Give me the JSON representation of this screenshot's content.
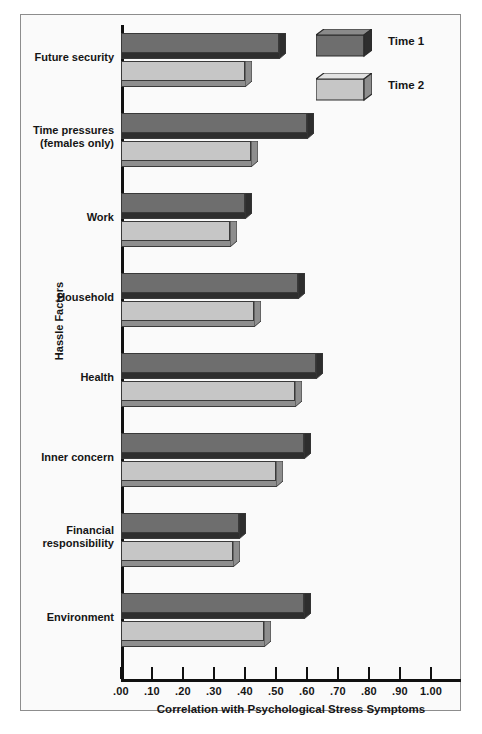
{
  "chart_data": {
    "type": "bar",
    "orientation": "horizontal",
    "title": "",
    "xlabel": "Correlation with Psychological Stress Symptoms",
    "ylabel": "Hassle Factors",
    "xlim": [
      0.0,
      1.0
    ],
    "grid": false,
    "legend_position": "top-right",
    "xticks": [
      ".00",
      ".10",
      ".20",
      ".30",
      ".40",
      ".50",
      ".60",
      ".70",
      ".80",
      ".90",
      "1.00"
    ],
    "xtick_values": [
      0.0,
      0.1,
      0.2,
      0.3,
      0.4,
      0.5,
      0.6,
      0.7,
      0.8,
      0.9,
      1.0
    ],
    "categories": [
      "Future security",
      "Time pressures\n(females only)",
      "Work",
      "Household",
      "Health",
      "Inner concern",
      "Financial\nresponsibility",
      "Environment"
    ],
    "category_lines": [
      [
        "Future security"
      ],
      [
        "Time pressures",
        "(females only)"
      ],
      [
        "Work"
      ],
      [
        "Household"
      ],
      [
        "Health"
      ],
      [
        "Inner concern"
      ],
      [
        "Financial",
        "responsibility"
      ],
      [
        "Environment"
      ]
    ],
    "series": [
      {
        "name": "Time 1",
        "color": "#6e6e6e",
        "values": [
          0.51,
          0.6,
          0.4,
          0.57,
          0.63,
          0.59,
          0.38,
          0.59
        ]
      },
      {
        "name": "Time 2",
        "color": "#c6c6c6",
        "values": [
          0.4,
          0.42,
          0.35,
          0.43,
          0.56,
          0.5,
          0.36,
          0.46
        ]
      }
    ]
  },
  "legend": {
    "entries": [
      {
        "label": "Time 1"
      },
      {
        "label": "Time 2"
      }
    ]
  },
  "axes": {
    "x_title": "Correlation with Psychological Stress Symptoms",
    "y_title": "Hassle Factors"
  }
}
